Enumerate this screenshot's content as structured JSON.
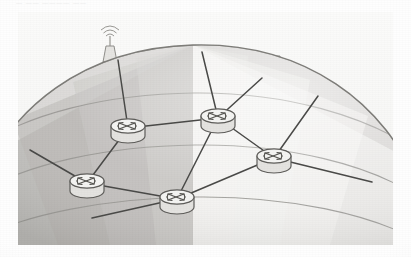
{
  "document": {
    "top_crop_text": "— —— ———— ——",
    "caption": ""
  },
  "figure": {
    "background_color": "#f7f7f6",
    "panel": {
      "x": 18,
      "y": 12,
      "width": 375,
      "height": 233
    }
  },
  "palette": {
    "paper": "#fefefe",
    "panel": "#f7f7f6",
    "globe_light": "#f1f0ee",
    "globe_mid": "#d9d8d5",
    "globe_dark": "#b9b8b4",
    "globe_darkest": "#a6a5a1",
    "grid_line": "#8b8a86",
    "link_line": "#4a4a48",
    "outline": "#6e6d69",
    "skyline": "#9a9996",
    "router_body": "#ededeb",
    "router_top": "#f6f6f4"
  },
  "globe": {
    "type": "sphere-segment",
    "description": "Upper hemisphere of a globe drawn in perspective with latitude arcs and longitude wedges shaded in alternating grays",
    "latitude_arc_count": 4,
    "longitude_band_count": 9,
    "shading_note": "Darker grays on the left limb, lightest grays toward the right limb"
  },
  "skyline": {
    "label": "city-skyline",
    "elements": [
      {
        "name": "radio-tower",
        "x": 110,
        "y": 28,
        "height": 72,
        "detail": "Lattice communications tower with antenna waves at the top"
      },
      {
        "name": "tower-block",
        "x": 96,
        "y": 70,
        "height": 34
      },
      {
        "name": "low-rise-cluster-left",
        "x": 78,
        "y": 80,
        "height": 26
      },
      {
        "name": "flag-building",
        "x": 168,
        "y": 48,
        "height": 48,
        "detail": "Tiered building topped with a pennant flag"
      },
      {
        "name": "mid-rise-cluster",
        "x": 186,
        "y": 60,
        "height": 38
      },
      {
        "name": "tree-left",
        "x": 62,
        "y": 98,
        "height": 20
      },
      {
        "name": "tree-center",
        "x": 232,
        "y": 58,
        "height": 28
      },
      {
        "name": "tower-right-a",
        "x": 258,
        "y": 56,
        "height": 46
      },
      {
        "name": "tower-right-b",
        "x": 272,
        "y": 50,
        "height": 52
      },
      {
        "name": "flag-right",
        "x": 322,
        "y": 78,
        "height": 20
      },
      {
        "name": "low-rise-right",
        "x": 314,
        "y": 92,
        "height": 22
      },
      {
        "name": "tree-right",
        "x": 352,
        "y": 110,
        "height": 20
      }
    ]
  },
  "topology": {
    "node_label": "router",
    "node_icon": "router-icon",
    "nodes": [
      {
        "id": "R1",
        "name": "router-upper-left",
        "x": 128,
        "y": 128
      },
      {
        "id": "R2",
        "name": "router-top-center",
        "x": 218,
        "y": 118
      },
      {
        "id": "R3",
        "name": "router-right",
        "x": 274,
        "y": 158
      },
      {
        "id": "R4",
        "name": "router-lower-left",
        "x": 87,
        "y": 183
      },
      {
        "id": "R5",
        "name": "router-bottom-center",
        "x": 177,
        "y": 199
      }
    ],
    "links": [
      {
        "from": "R1",
        "to": "R2"
      },
      {
        "from": "R1",
        "to": "R4"
      },
      {
        "from": "R2",
        "to": "R3"
      },
      {
        "from": "R2",
        "to": "R5"
      },
      {
        "from": "R3",
        "to": "R5"
      },
      {
        "from": "R4",
        "to": "R5"
      }
    ],
    "edge_links": [
      {
        "from": "R1",
        "to_point": [
          118,
          60
        ],
        "name": "link-r1-to-skyline"
      },
      {
        "from": "R2",
        "to_point": [
          202,
          52
        ],
        "name": "link-r2-to-skyline"
      },
      {
        "from": "R2",
        "to_point": [
          262,
          78
        ],
        "name": "link-r2-to-right-skyline"
      },
      {
        "from": "R3",
        "to_point": [
          318,
          96
        ],
        "name": "link-r3-to-right-skyline"
      },
      {
        "from": "R3",
        "to_point": [
          372,
          182
        ],
        "name": "link-r3-to-right-limb"
      },
      {
        "from": "R4",
        "to_point": [
          30,
          150
        ],
        "name": "link-r4-to-left-limb"
      },
      {
        "from": "R5",
        "to_point": [
          92,
          218
        ],
        "name": "link-r5-to-lower-left"
      }
    ],
    "node_count": 5,
    "link_count": 6
  }
}
